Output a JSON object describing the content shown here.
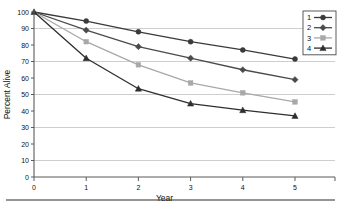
{
  "chart_data": {
    "type": "line",
    "title": "",
    "xlabel": "Year",
    "ylabel": "Percent Alive",
    "x": [
      0,
      1,
      2,
      3,
      4,
      5
    ],
    "xlim": [
      0,
      5
    ],
    "ylim": [
      0,
      100
    ],
    "xticks": [
      "0",
      "1",
      "2",
      "3",
      "4",
      "5"
    ],
    "yticks": [
      "0",
      "10",
      "20",
      "30",
      "40",
      "50",
      "60",
      "70",
      "80",
      "90",
      "100"
    ],
    "grid": "horizontal",
    "legend_position": "top-right",
    "series": [
      {
        "name": "1",
        "marker": "circle",
        "color": "#3a3a3a",
        "values": [
          100,
          94.5,
          88,
          82,
          77,
          71.5
        ]
      },
      {
        "name": "2",
        "marker": "diamond",
        "color": "#4a4a4a",
        "values": [
          100,
          89,
          79,
          72,
          65,
          59
        ]
      },
      {
        "name": "3",
        "marker": "square",
        "color": "#a8a8a8",
        "values": [
          100,
          82,
          68,
          57,
          51,
          45.5
        ]
      },
      {
        "name": "4",
        "marker": "triangle",
        "color": "#2e2e2e",
        "values": [
          100,
          72,
          53.5,
          44.5,
          40.5,
          37
        ]
      }
    ]
  },
  "legend": {
    "entries": [
      {
        "label": "1"
      },
      {
        "label": "2"
      },
      {
        "label": "3"
      },
      {
        "label": "4"
      }
    ]
  },
  "axes": {
    "x_title": "Year",
    "y_title": "Percent Alive"
  }
}
